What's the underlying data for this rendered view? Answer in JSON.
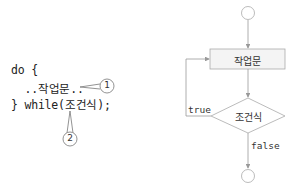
{
  "code": {
    "line1": "do {",
    "line2": "  ..작업문..",
    "line3": "} while(조건식);"
  },
  "callouts": [
    {
      "label": "1",
      "target": "작업문"
    },
    {
      "label": "2",
      "target": "조건식"
    }
  ],
  "flowchart": {
    "start": "",
    "process": "작업문",
    "decision": "조건식",
    "true_label": "true",
    "false_label": "false",
    "end": ""
  }
}
